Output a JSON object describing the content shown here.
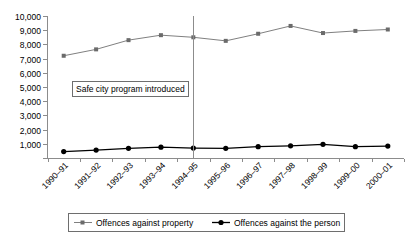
{
  "chart_data": {
    "type": "line",
    "title": "",
    "xlabel": "",
    "ylabel": "",
    "ylim": [
      0,
      10000
    ],
    "ytick_step": 1000,
    "grid": false,
    "legend_position": "bottom",
    "categories": [
      "1990–91",
      "1991–92",
      "1992–93",
      "1993–94",
      "1994–95",
      "1995–96",
      "1996–97",
      "1997–98",
      "1998–99",
      "1999–00",
      "2000–01"
    ],
    "ytick_labels": [
      "0",
      "1,000",
      "2,000",
      "3,000",
      "4,000",
      "5,000",
      "6,000",
      "7,000",
      "8,000",
      "9,000",
      "10,000"
    ],
    "series": [
      {
        "name": "Offences against property",
        "color": "#808080",
        "marker": "square",
        "values": [
          7200,
          7650,
          8300,
          8650,
          8500,
          8250,
          8750,
          9300,
          8800,
          8950,
          9050
        ]
      },
      {
        "name": "Offences against the person",
        "color": "#000000",
        "marker": "circle",
        "values": [
          450,
          560,
          680,
          760,
          700,
          680,
          800,
          860,
          960,
          800,
          840
        ]
      }
    ],
    "annotations": [
      {
        "text": "Safe city program introduced",
        "at_category": "1994–95",
        "kind": "vertical-line-with-label"
      }
    ]
  },
  "legend": {
    "items": [
      {
        "label": "Offences against property",
        "marker": "square-gray-line"
      },
      {
        "label": "Offences against the person",
        "marker": "circle-black-line"
      }
    ]
  }
}
